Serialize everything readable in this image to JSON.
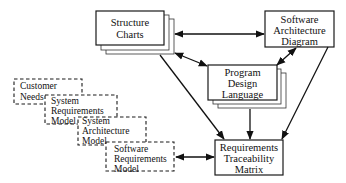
{
  "diagram": {
    "type": "software artifacts relationship diagram",
    "nodes": {
      "structure_charts": {
        "line1": "Structure",
        "line2": "Charts",
        "style": "solid-stacked"
      },
      "software_architecture": {
        "line1": "Software",
        "line2": "Architecture",
        "line3": "Diagram",
        "style": "solid"
      },
      "pdl": {
        "line1": "Program",
        "line2": "Design",
        "line3": "Language",
        "style": "solid-stacked"
      },
      "rtm": {
        "line1": "Requirements",
        "line2": "Traceability",
        "line3": "Matrix",
        "style": "solid"
      },
      "customer_needs": {
        "line1": "Customer",
        "line2": "Needs",
        "style": "dashed"
      },
      "system_requirements": {
        "line1": "System",
        "line2": "Requirements",
        "line3": "Model",
        "style": "dashed"
      },
      "system_architecture": {
        "line1": "System",
        "line2": "Architecture",
        "line3": "Model",
        "style": "dashed"
      },
      "software_requirements": {
        "line1": "Software",
        "line2": "Requirements",
        "line3": "Model",
        "style": "dashed"
      }
    },
    "edges": [
      {
        "from": "structure_charts",
        "to": "software_architecture",
        "direction": "bidirectional"
      },
      {
        "from": "structure_charts",
        "to": "pdl",
        "direction": "bidirectional"
      },
      {
        "from": "software_architecture",
        "to": "pdl",
        "direction": "bidirectional"
      },
      {
        "from": "structure_charts",
        "to": "rtm",
        "direction": "forward"
      },
      {
        "from": "pdl",
        "to": "rtm",
        "direction": "forward"
      },
      {
        "from": "software_architecture",
        "to": "rtm",
        "direction": "forward"
      },
      {
        "from": "software_requirements",
        "to": "rtm",
        "direction": "bidirectional"
      }
    ]
  }
}
